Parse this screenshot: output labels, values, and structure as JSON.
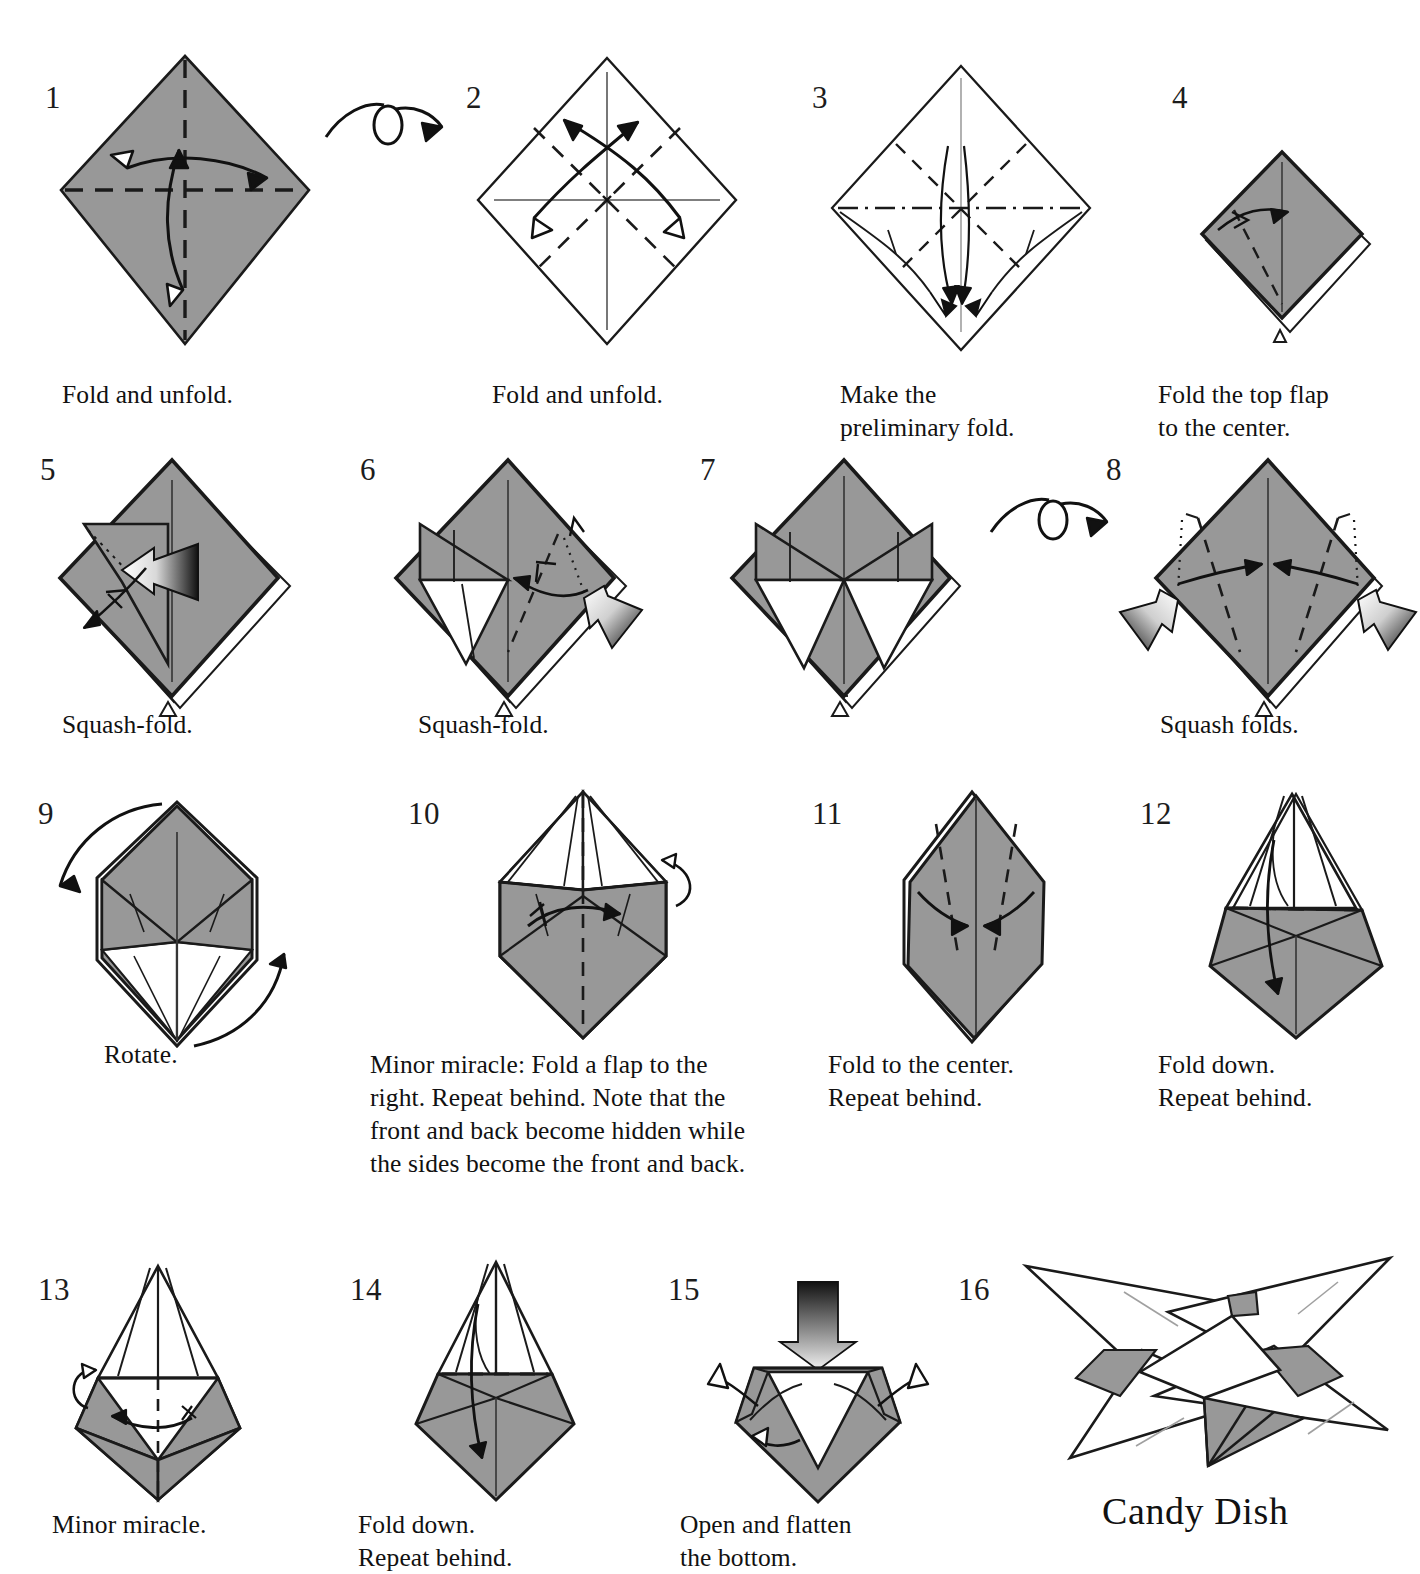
{
  "document": {
    "title_partial": "Candy Dish",
    "model_name": "Candy Dish",
    "paper_gray": "#989898",
    "paper_gray_light": "#a8a8a8",
    "line_color": "#1a1a1a",
    "white": "#ffffff"
  },
  "steps": [
    {
      "number": "1",
      "caption": "Fold and unfold.",
      "figure": "square-flat-gray-diamond-with-cross-creases",
      "icon_names": [
        "fold-arrow-up",
        "fold-arrow-right",
        "unfold-arrow-left",
        "unfold-arrow-down",
        "crease-line-vertical",
        "crease-line-horizontal"
      ]
    },
    {
      "number": "2",
      "caption": "Fold and unfold.",
      "figure": "white-diamond-with-diagonal-creases",
      "icon_names": [
        "fold-arrow-upleft",
        "fold-arrow-upright",
        "unfold-arrow-downleft",
        "unfold-arrow-downright",
        "crease-line-vertical",
        "crease-line-horizontal"
      ]
    },
    {
      "number": "3",
      "caption": "Make the\npreliminary fold.",
      "figure": "white-diamond-preliminary-collapse",
      "icon_names": [
        "collapse-arrow-down",
        "dash-dot-crease-horizontal"
      ]
    },
    {
      "number": "4",
      "caption": "Fold the top flap\nto the center.",
      "figure": "gray-preliminary-base",
      "icon_names": [
        "fold-arrow-right-curved",
        "valley-crease-dashed"
      ]
    },
    {
      "number": "5",
      "caption": "Squash-fold.",
      "figure": "gray-base-with-squash-flap",
      "icon_names": [
        "push-arrow-left-shaded",
        "fold-arrow-downleft"
      ]
    },
    {
      "number": "6",
      "caption": "Squash-fold.",
      "figure": "gray-base-one-squash-done",
      "icon_names": [
        "push-arrow-upleft-shaded",
        "fold-arrow-left-curved",
        "valley-crease-dashed",
        "mountain-crease-dotted"
      ]
    },
    {
      "number": "7",
      "caption": "",
      "figure": "gray-base-two-squashes-done",
      "icon_names": [
        "turn-over-arrow"
      ]
    },
    {
      "number": "8",
      "caption": "Squash folds.",
      "figure": "gray-base-back-side",
      "icon_names": [
        "push-arrow-right-shaded",
        "push-arrow-left-shaded",
        "fold-arrow-in-left",
        "fold-arrow-in-right",
        "valley-crease-dashed",
        "mountain-crease-dotted"
      ]
    },
    {
      "number": "9",
      "caption": "Rotate.",
      "figure": "hexagonal-gray-form",
      "icon_names": [
        "rotate-arrow-left",
        "rotate-arrow-right"
      ]
    },
    {
      "number": "10",
      "caption": "Minor miracle: Fold a flap to the right. Repeat behind. Note that the front and back become hidden while the sides become the front and back.",
      "figure": "tall-gray-form-with-flaps",
      "icon_names": [
        "fold-arrow-right",
        "repeat-behind-arrow",
        "valley-crease-dashed"
      ]
    },
    {
      "number": "11",
      "caption": "Fold to the center.\nRepeat behind.",
      "figure": "gray-elongated-hexagon",
      "icon_names": [
        "fold-arrow-in-left",
        "fold-arrow-in-right",
        "valley-crease-dashed"
      ]
    },
    {
      "number": "12",
      "caption": "Fold down.\nRepeat behind.",
      "figure": "narrow-kite-with-gray-bottom",
      "icon_names": [
        "fold-arrow-down",
        "valley-crease-dashed-horizontal"
      ]
    },
    {
      "number": "13",
      "caption": "Minor miracle.",
      "figure": "narrow-form-white-top-gray-bottom",
      "icon_names": [
        "fold-arrow-left",
        "repeat-behind-arrow",
        "valley-crease-dashed"
      ]
    },
    {
      "number": "14",
      "caption": "Fold down.\nRepeat behind.",
      "figure": "kite-gray-lower-white-upper",
      "icon_names": [
        "fold-arrow-down",
        "valley-crease-dashed-horizontal"
      ]
    },
    {
      "number": "15",
      "caption": "Open and flatten\nthe bottom.",
      "figure": "open-cup-form",
      "icon_names": [
        "push-arrow-down-shaded",
        "open-arrow-upleft",
        "open-arrow-upright",
        "open-arrow-inward"
      ]
    },
    {
      "number": "16",
      "caption": "",
      "figure": "finished-candy-dish-star",
      "icon_names": []
    }
  ]
}
